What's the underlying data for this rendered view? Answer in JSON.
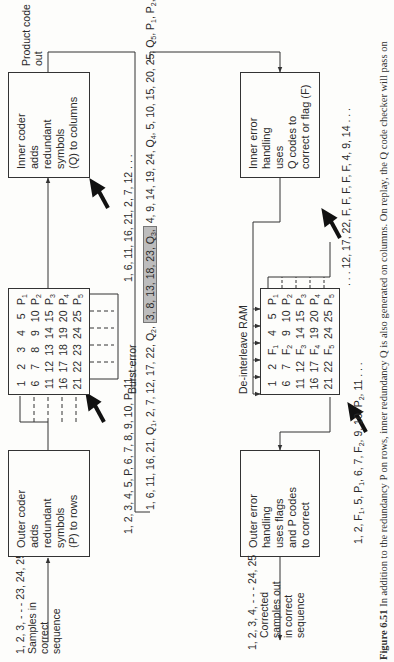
{
  "figure": {
    "caption_label": "Figure 6.51",
    "caption_text": "In addition to the redundancy P on rows, inner redundancy Q is also generated on columns. On replay, the Q code checker will pass on"
  },
  "encode": {
    "input_sequence": "1, 2, 3, - - - 23, 24, 25",
    "input_label": [
      "Samples in",
      "correct",
      "sequence"
    ],
    "outer_coder": [
      "Outer coder",
      "adds",
      "redundant",
      "symbols",
      "(P) to rows"
    ],
    "after_outer": "1, 2, 3, 4, 5, P, 6, 7, 8, 9, 10, P, 11 . . .",
    "interleave_matrix": [
      [
        "1",
        "2",
        "3",
        "4",
        "5",
        "P1"
      ],
      [
        "6",
        "7",
        "8",
        "9",
        "10",
        "P2"
      ],
      [
        "11",
        "12",
        "13",
        "14",
        "15",
        "P3"
      ],
      [
        "16",
        "17",
        "18",
        "19",
        "20",
        "P4"
      ],
      [
        "21",
        "22",
        "23",
        "24",
        "25",
        "P5"
      ]
    ],
    "after_interleave": "1, 6, 11, 16, 21, 2, 7, 12 . . .",
    "inner_coder": [
      "Inner coder",
      "adds",
      "redundant",
      "symbols",
      "(Q) to columns"
    ],
    "output_label": [
      "Product code",
      "out"
    ]
  },
  "channel": {
    "stream_before": "1, 6, 11, 16, 21, Q1, 2, 7, 12, 17, 22, Q2,",
    "burst_label": "Burst error",
    "burst_segment": "3, 8, 13, 18, 23, Q3,",
    "stream_after": "4, 9, 14, 19, 24, Q4, 5, 10, 15, 20, 25, Q5, P1, P2, P3, P4, P5, Q6"
  },
  "decode": {
    "inner_error": [
      "Inner error",
      "handling",
      "uses",
      "Q codes to",
      "correct or flag (F)"
    ],
    "after_inner": ". . . 12, 17, 22, F, F, F, F, F, 4, 9, 14 . . .",
    "deinterleave_label": "De-interleave RAM",
    "deinterleave_matrix": [
      [
        "1",
        "2",
        "F1",
        "4",
        "5",
        "P1"
      ],
      [
        "6",
        "7",
        "F2",
        "9",
        "10",
        "P2"
      ],
      [
        "11",
        "12",
        "F3",
        "14",
        "15",
        "P3"
      ],
      [
        "16",
        "17",
        "F4",
        "19",
        "20",
        "P4"
      ],
      [
        "21",
        "22",
        "F5",
        "24",
        "25",
        "P5"
      ]
    ],
    "after_deinterleave": "1, 2, F1, 5, P1, 6, 7, F2, 9, 10, P2, 11 . . .",
    "outer_error": [
      "Outer error",
      "handling",
      "uses flags",
      "and P codes",
      "to correct"
    ],
    "output_sequence": "1, 2, 3, 4, - - - 24, 25",
    "output_label": [
      "Corrected",
      "samples out",
      "in correct",
      "sequence"
    ]
  },
  "colors": {
    "line": "#333333",
    "burst_fill": "#bdbdbd",
    "background": "#fdfdfb"
  }
}
